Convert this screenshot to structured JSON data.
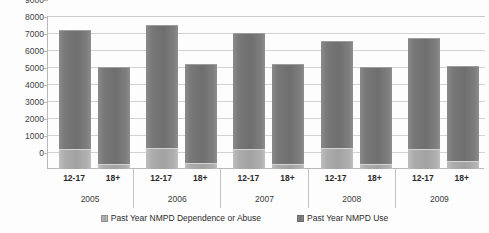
{
  "chart_data": {
    "type": "bar",
    "stacked": true,
    "title": "",
    "xlabel": "",
    "ylabel": "",
    "ylim": [
      0,
      9000
    ],
    "ytick_interval": 1000,
    "ytick_labels": [
      "9000",
      "8000",
      "7000",
      "6000",
      "5000",
      "4000",
      "3000",
      "2000",
      "1000",
      "0"
    ],
    "ytick_values": [
      9000,
      8000,
      7000,
      6000,
      5000,
      4000,
      3000,
      2000,
      1000,
      0
    ],
    "grid": true,
    "legend_position": "bottom",
    "years": [
      "2005",
      "2006",
      "2007",
      "2008",
      "2009"
    ],
    "age_groups": [
      "12-17",
      "18+"
    ],
    "categories": [
      "2005 12-17",
      "2005 18+",
      "2006 12-17",
      "2006 18+",
      "2007 12-17",
      "2007 18+",
      "2008 12-17",
      "2008 18+",
      "2009 12-17",
      "2009 18+"
    ],
    "series": [
      {
        "name": "Past Year NMPD Dependence or Abuse",
        "color": "#a2a2a2",
        "values": [
          1200,
          300,
          1250,
          350,
          1150,
          320,
          1250,
          300,
          1200,
          450
        ]
      },
      {
        "name": "Past Year NMPD Use",
        "color": "#6f6f6f",
        "values": [
          7000,
          5700,
          7250,
          5850,
          6850,
          5880,
          6300,
          5700,
          6500,
          5600
        ]
      }
    ],
    "stack_totals": [
      8200,
      6000,
      8500,
      6200,
      8000,
      6200,
      7550,
      6000,
      7700,
      6050
    ],
    "groups": [
      {
        "year": "2005",
        "bars": [
          {
            "age": "12-17",
            "dependence_or_abuse": 1200,
            "use": 7000,
            "total": 8200
          },
          {
            "age": "18+",
            "dependence_or_abuse": 300,
            "use": 5700,
            "total": 6000
          }
        ]
      },
      {
        "year": "2006",
        "bars": [
          {
            "age": "12-17",
            "dependence_or_abuse": 1250,
            "use": 7250,
            "total": 8500
          },
          {
            "age": "18+",
            "dependence_or_abuse": 350,
            "use": 5850,
            "total": 6200
          }
        ]
      },
      {
        "year": "2007",
        "bars": [
          {
            "age": "12-17",
            "dependence_or_abuse": 1150,
            "use": 6850,
            "total": 8000
          },
          {
            "age": "18+",
            "dependence_or_abuse": 320,
            "use": 5880,
            "total": 6200
          }
        ]
      },
      {
        "year": "2008",
        "bars": [
          {
            "age": "12-17",
            "dependence_or_abuse": 1250,
            "use": 6300,
            "total": 7550
          },
          {
            "age": "18+",
            "dependence_or_abuse": 300,
            "use": 5700,
            "total": 6000
          }
        ]
      },
      {
        "year": "2009",
        "bars": [
          {
            "age": "12-17",
            "dependence_or_abuse": 1200,
            "use": 6500,
            "total": 7700
          },
          {
            "age": "18+",
            "dependence_or_abuse": 450,
            "use": 5600,
            "total": 6050
          }
        ]
      }
    ]
  },
  "legend": {
    "items": [
      {
        "label": "Past Year NMPD Dependence or Abuse",
        "swatch": "dep"
      },
      {
        "label": "Past Year NMPD Use",
        "swatch": "use"
      }
    ]
  },
  "colors": {
    "series_use": "#6f6f6f",
    "series_dependence": "#a2a2a2",
    "gridline": "#d2d2d2",
    "axis": "#b9b9b9",
    "text": "#2b2b2b",
    "background": "#fdfdfd"
  }
}
